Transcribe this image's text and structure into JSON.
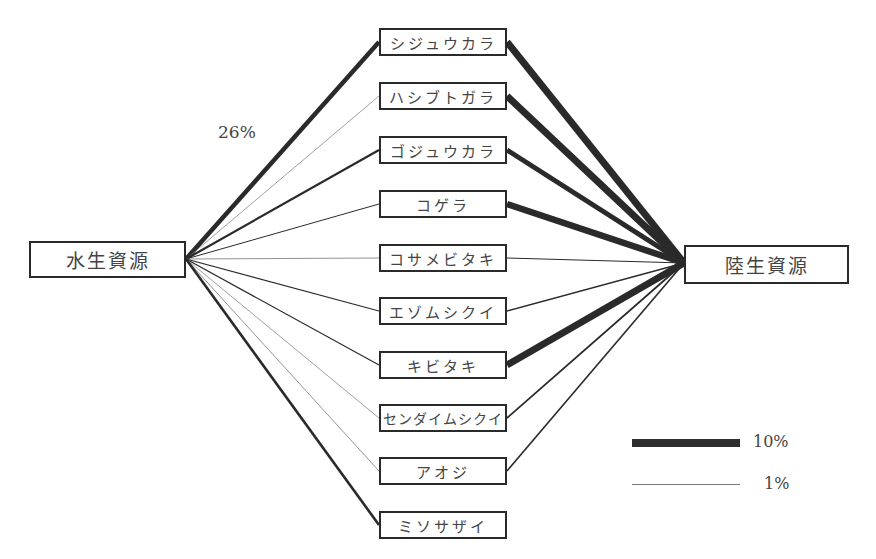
{
  "hubs": {
    "left": {
      "label": "水生資源"
    },
    "right": {
      "label": "陸生資源"
    }
  },
  "species": [
    {
      "label": "シジュウカラ",
      "aquatic_width": 4.5,
      "terrestrial_width": 7
    },
    {
      "label": "ハシブトガラ",
      "aquatic_width": 0.7,
      "terrestrial_width": 7
    },
    {
      "label": "ゴジュウカラ",
      "aquatic_width": 2.2,
      "terrestrial_width": 5
    },
    {
      "label": "コゲラ",
      "aquatic_width": 1,
      "terrestrial_width": 6.5
    },
    {
      "label": "コサメビタキ",
      "aquatic_width": 0.8,
      "terrestrial_width": 1
    },
    {
      "label": "エゾムシクイ",
      "aquatic_width": 1.2,
      "terrestrial_width": 1.3
    },
    {
      "label": "キビタキ",
      "aquatic_width": 1.2,
      "terrestrial_width": 7
    },
    {
      "label": "センダイムシクイ",
      "aquatic_width": 0.7,
      "terrestrial_width": 1.8
    },
    {
      "label": "アオジ",
      "aquatic_width": 0.8,
      "terrestrial_width": 1.6
    },
    {
      "label": "ミソサザイ",
      "aquatic_width": 2.6,
      "terrestrial_width": 0
    }
  ],
  "annotation": "26%",
  "legend": {
    "items": [
      {
        "label": "10%",
        "width": 8
      },
      {
        "label": "1%",
        "width": 1
      }
    ]
  }
}
